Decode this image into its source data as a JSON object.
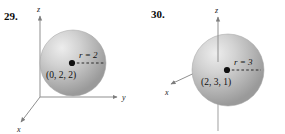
{
  "page": {
    "background": "#ffffff",
    "type": "textbook-exercise-figures"
  },
  "figures": [
    {
      "number": "29.",
      "sphere": {
        "radius_label": "r = 2",
        "center_label": "(0, 2, 2)",
        "radius_value": 2,
        "center": [
          0,
          2,
          2
        ],
        "fill_color": "#b8b8b8",
        "highlight_color": "#e8e8e8"
      },
      "axes": {
        "z_label": "z",
        "y_label": "y",
        "x_label": "x",
        "axis_color": "#8a8a8a",
        "z_through_sphere": false
      }
    },
    {
      "number": "30.",
      "sphere": {
        "radius_label": "r = 3",
        "center_label": "(2, 3, 1)",
        "radius_value": 3,
        "center": [
          2,
          3,
          1
        ],
        "fill_color": "#b8b8b8",
        "highlight_color": "#e8e8e8"
      },
      "axes": {
        "z_label": "z",
        "y_label": "y",
        "x_label": "x",
        "axis_color": "#8a8a8a",
        "z_through_sphere": true
      }
    }
  ]
}
